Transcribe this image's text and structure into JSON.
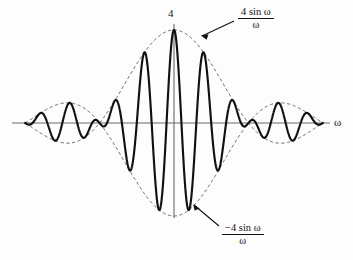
{
  "figure": {
    "kind": "sinc-modulated-waveform-plot",
    "background_color": "#fdfdfd",
    "curve_color": "#111111",
    "envelope_color": "#4a4a4a",
    "axis_color": "#6a6a6a",
    "peak_label": "4",
    "omega_axis_label": "ω",
    "upper_envelope_label": {
      "numerator": "4 sin ω",
      "denominator": "ω"
    },
    "lower_envelope_label": {
      "numerator": "−4 sin ω",
      "denominator": "ω"
    }
  },
  "chart_data": {
    "type": "line",
    "title": "",
    "xlabel": "ω",
    "ylabel": "",
    "xlim": [
      -6.283185,
      6.283185
    ],
    "ylim": [
      -4,
      4
    ],
    "grid": false,
    "legend": "none",
    "origin_px": {
      "x": 174,
      "y": 123
    },
    "px_per_x_unit": 23.7,
    "px_per_y_unit": 23.25,
    "series": [
      {
        "name": "4 sin(ω)/ω (upper envelope)",
        "style": "dashed",
        "formula": "4*sin(w)/w",
        "peak_value": 4,
        "zeros": [
          -6.283185,
          -3.141593,
          3.141593,
          6.283185
        ]
      },
      {
        "name": "−4 sin(ω)/ω (lower envelope)",
        "style": "dashed",
        "formula": "-4*sin(w)/w",
        "peak_value": -4,
        "zeros": [
          -6.283185,
          -3.141593,
          3.141593,
          6.283185
        ]
      },
      {
        "name": "modulated signal",
        "style": "solid",
        "formula": "4*sin(w)/w*cos(5*w)",
        "carrier_cycles_per_2pi": 5
      }
    ],
    "annotations": [
      {
        "text": "4",
        "x": 0,
        "y": 4.2,
        "kind": "peak-value"
      },
      {
        "text": "4 sin ω / ω",
        "x": 2.9,
        "y": 4.6,
        "kind": "upper-envelope-callout"
      },
      {
        "text": "−4 sin ω / ω",
        "x": 2.3,
        "y": -4.5,
        "kind": "lower-envelope-callout"
      },
      {
        "text": "ω",
        "x": 6.8,
        "y": 0,
        "kind": "axis-label"
      }
    ]
  }
}
